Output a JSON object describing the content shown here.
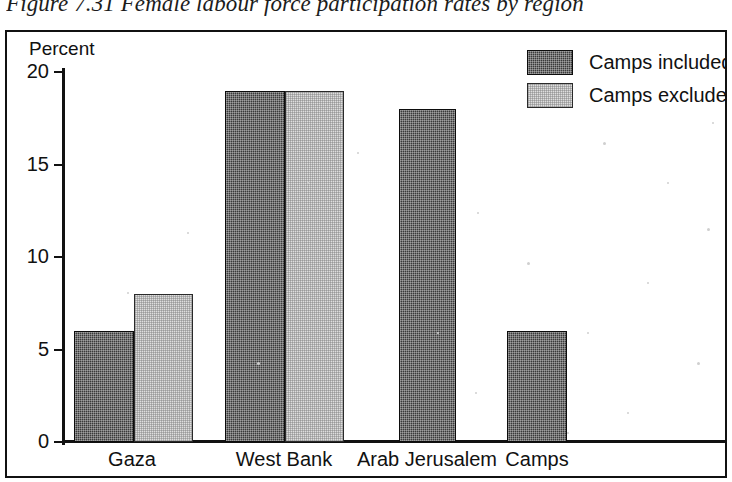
{
  "figure": {
    "caption": "Figure 7.31 Female labour force participation rates by region"
  },
  "chart_data": {
    "type": "bar",
    "title": "Figure 7.31 Female labour force participation rates by region",
    "xlabel": "",
    "ylabel": "Percent",
    "ylim": [
      0,
      20
    ],
    "yticks": [
      0,
      5,
      10,
      15,
      20
    ],
    "ytick_labels": [
      "0",
      "5",
      "10",
      "15",
      "20"
    ],
    "grid": false,
    "legend_position": "top-right",
    "categories": [
      "Gaza",
      "West Bank",
      "Arab Jerusalem",
      "Camps"
    ],
    "series": [
      {
        "name": "Camps included",
        "color": "#3a3a3a",
        "values": [
          6,
          19,
          18,
          6
        ]
      },
      {
        "name": "Camps excluded",
        "color": "#dedede",
        "values": [
          8,
          19,
          null,
          null
        ]
      }
    ]
  },
  "legend": {
    "items": [
      {
        "label": "Camps included",
        "swatch": "dark"
      },
      {
        "label": "Camps excluded",
        "swatch": "light"
      }
    ]
  }
}
